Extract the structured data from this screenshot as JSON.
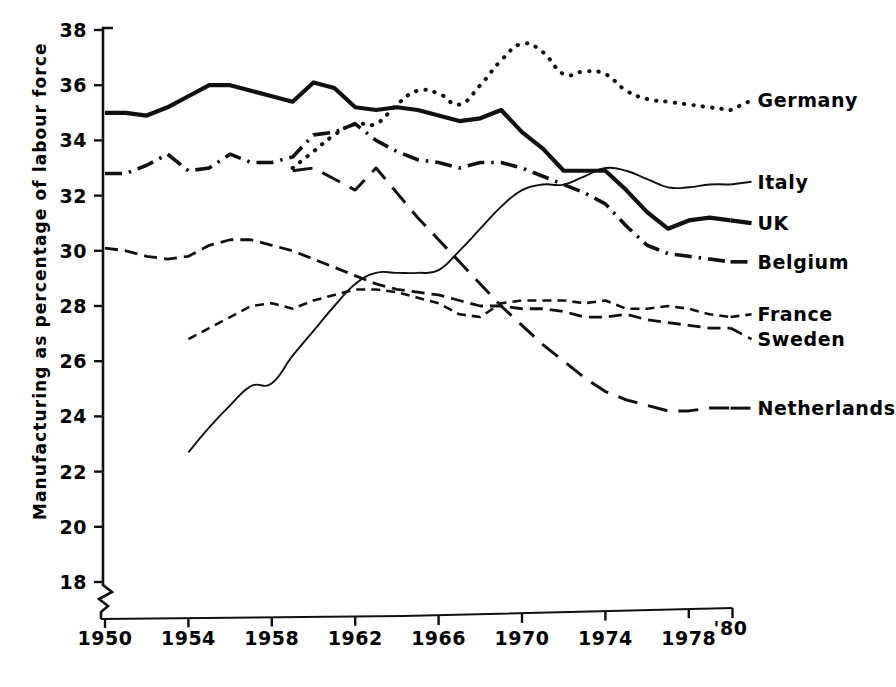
{
  "chart_data": {
    "type": "line",
    "title": "",
    "xlabel": "",
    "ylabel": "Manufacturing as percentage of labour force",
    "xlim": [
      1950,
      1980
    ],
    "ylim": [
      17.2,
      38
    ],
    "grid": false,
    "legend_position": "right-inline-labels",
    "axis_break_y": true,
    "xticks": [
      "1950",
      "1954",
      "1958",
      "1962",
      "1966",
      "1970",
      "1974",
      "1978",
      "'80"
    ],
    "xtick_values": [
      1950,
      1954,
      1958,
      1962,
      1966,
      1970,
      1974,
      1978,
      1980
    ],
    "yticks": [
      "18",
      "20",
      "22",
      "24",
      "26",
      "28",
      "30",
      "32",
      "34",
      "36",
      "38"
    ],
    "ytick_values": [
      18,
      20,
      22,
      24,
      26,
      28,
      30,
      32,
      34,
      36,
      38
    ],
    "series": [
      {
        "name": "Germany",
        "label": "Germany",
        "style": "dotted",
        "label_x": 1981.2,
        "label_y": 35.45,
        "x": [
          1959,
          1960,
          1961,
          1962,
          1963,
          1964,
          1965,
          1966,
          1967,
          1968,
          1969,
          1970,
          1971,
          1972,
          1973,
          1974,
          1975,
          1976,
          1977,
          1978,
          1979,
          1980
        ],
        "y": [
          33.0,
          33.6,
          34.2,
          34.6,
          34.6,
          35.3,
          35.8,
          35.7,
          35.3,
          36.0,
          36.9,
          37.5,
          37.2,
          36.4,
          36.5,
          36.4,
          35.8,
          35.5,
          35.4,
          35.3,
          35.2,
          35.1
        ]
      },
      {
        "name": "Italy",
        "label": "Italy",
        "style": "thin-solid",
        "label_x": 1981.2,
        "label_y": 32.5,
        "x": [
          1954,
          1955,
          1956,
          1957,
          1958,
          1959,
          1960,
          1961,
          1962,
          1963,
          1964,
          1965,
          1966,
          1967,
          1968,
          1969,
          1970,
          1971,
          1972,
          1973,
          1974,
          1975,
          1976,
          1977,
          1978,
          1979,
          1980
        ],
        "y": [
          22.7,
          23.6,
          24.4,
          25.1,
          25.2,
          26.2,
          27.1,
          28.0,
          28.8,
          29.2,
          29.2,
          29.2,
          29.3,
          30.0,
          30.8,
          31.6,
          32.2,
          32.4,
          32.4,
          32.7,
          33.0,
          32.9,
          32.6,
          32.3,
          32.3,
          32.4,
          32.4
        ]
      },
      {
        "name": "UK",
        "label": "UK",
        "style": "thick-solid",
        "label_x": 1981.2,
        "label_y": 31.0,
        "x": [
          1950,
          1951,
          1952,
          1953,
          1954,
          1955,
          1956,
          1957,
          1958,
          1959,
          1960,
          1961,
          1962,
          1963,
          1964,
          1965,
          1966,
          1967,
          1968,
          1969,
          1970,
          1971,
          1972,
          1973,
          1974,
          1975,
          1976,
          1977,
          1978,
          1979,
          1980
        ],
        "y": [
          35.0,
          35.0,
          34.9,
          35.2,
          35.6,
          36.0,
          36.0,
          35.8,
          35.6,
          35.4,
          36.1,
          35.9,
          35.2,
          35.1,
          35.2,
          35.1,
          34.9,
          34.7,
          34.8,
          35.1,
          34.3,
          33.7,
          32.9,
          32.9,
          32.9,
          32.2,
          31.4,
          30.8,
          31.1,
          31.2,
          31.1
        ]
      },
      {
        "name": "Belgium",
        "label": "Belgium",
        "style": "dash-dot",
        "label_x": 1981.2,
        "label_y": 29.6,
        "x": [
          1950,
          1951,
          1952,
          1953,
          1954,
          1955,
          1956,
          1957,
          1958,
          1959,
          1960,
          1961,
          1962,
          1963,
          1964,
          1965,
          1966,
          1967,
          1968,
          1969,
          1970,
          1971,
          1972,
          1973,
          1974,
          1975,
          1976,
          1977,
          1978,
          1979,
          1980
        ],
        "y": [
          32.8,
          32.8,
          33.1,
          33.5,
          32.9,
          33.0,
          33.5,
          33.2,
          33.2,
          33.4,
          34.2,
          34.3,
          34.6,
          34.0,
          33.6,
          33.3,
          33.2,
          33.0,
          33.2,
          33.2,
          33.0,
          32.7,
          32.4,
          32.1,
          31.7,
          30.9,
          30.2,
          29.9,
          29.8,
          29.7,
          29.6
        ]
      },
      {
        "name": "France",
        "label": "France",
        "style": "short-dash",
        "label_x": 1981.2,
        "label_y": 27.7,
        "x": [
          1954,
          1955,
          1956,
          1957,
          1958,
          1959,
          1960,
          1961,
          1962,
          1963,
          1964,
          1965,
          1966,
          1967,
          1968,
          1969,
          1970,
          1971,
          1972,
          1973,
          1974,
          1975,
          1976,
          1977,
          1978,
          1979,
          1980
        ],
        "y": [
          26.8,
          27.2,
          27.6,
          28.0,
          28.1,
          27.9,
          28.2,
          28.4,
          28.6,
          28.6,
          28.5,
          28.3,
          28.1,
          27.7,
          27.6,
          28.1,
          28.2,
          28.2,
          28.2,
          28.1,
          28.2,
          27.9,
          27.9,
          28.0,
          27.9,
          27.7,
          27.6
        ]
      },
      {
        "name": "Sweden",
        "label": "Sweden",
        "style": "medium-dash",
        "label_x": 1981.2,
        "label_y": 26.8,
        "x": [
          1950,
          1951,
          1952,
          1953,
          1954,
          1955,
          1956,
          1957,
          1958,
          1959,
          1960,
          1961,
          1962,
          1963,
          1964,
          1965,
          1966,
          1967,
          1968,
          1969,
          1970,
          1971,
          1972,
          1973,
          1974,
          1975,
          1976,
          1977,
          1978,
          1979,
          1980
        ],
        "y": [
          30.1,
          30.0,
          29.8,
          29.7,
          29.8,
          30.2,
          30.4,
          30.4,
          30.2,
          30.0,
          29.7,
          29.4,
          29.1,
          28.8,
          28.6,
          28.5,
          28.4,
          28.2,
          28.0,
          28.0,
          27.9,
          27.9,
          27.8,
          27.6,
          27.6,
          27.7,
          27.5,
          27.4,
          27.3,
          27.2,
          27.2
        ]
      },
      {
        "name": "Netherlands",
        "label": "Netherlands",
        "style": "long-dash",
        "label_x": 1981.2,
        "label_y": 24.3,
        "x": [
          1959,
          1960,
          1961,
          1962,
          1963,
          1964,
          1965,
          1966,
          1967,
          1968,
          1969,
          1970,
          1971,
          1972,
          1973,
          1974,
          1975,
          1976,
          1977,
          1978,
          1979,
          1980
        ],
        "y": [
          32.9,
          33.0,
          32.6,
          32.2,
          33.0,
          32.1,
          31.2,
          30.4,
          29.6,
          28.8,
          28.0,
          27.3,
          26.6,
          26.0,
          25.4,
          24.9,
          24.6,
          24.4,
          24.2,
          24.2,
          24.3,
          24.3
        ]
      }
    ]
  }
}
